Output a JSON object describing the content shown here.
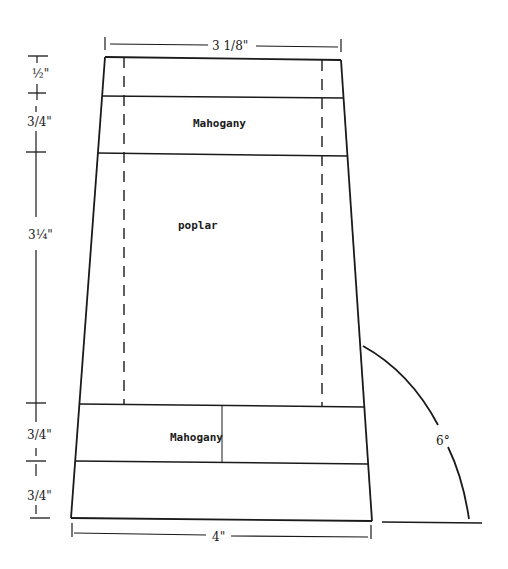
{
  "diagram": {
    "type": "technical-drawing",
    "dimensions": {
      "top_width": "3 1/8\"",
      "bottom_width": "4\"",
      "angle": "6°",
      "heights": [
        {
          "label": "½\"",
          "segment": "top strip"
        },
        {
          "label": "3/4\"",
          "segment": "upper mahogany"
        },
        {
          "label": "3¼\"",
          "segment": "poplar core"
        },
        {
          "label": "3/4\"",
          "segment": "lower mahogany"
        },
        {
          "label": "3/4\"",
          "segment": "bottom strip"
        }
      ]
    },
    "layers": [
      {
        "name": "top-strip",
        "material": ""
      },
      {
        "name": "upper-layer",
        "material": "Mahogany"
      },
      {
        "name": "core",
        "material": "poplar"
      },
      {
        "name": "lower-layer",
        "material": "Mahogany"
      },
      {
        "name": "base",
        "material": ""
      }
    ]
  }
}
